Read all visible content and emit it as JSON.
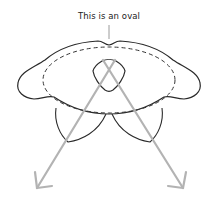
{
  "diagram": {
    "label": "This is an oval",
    "colors": {
      "outline": "#2a2a2a",
      "dashed_oval": "#333333",
      "arrow": "#b3b3b3",
      "pointer": "#9a9a9a",
      "background": "#ffffff"
    },
    "elements": [
      {
        "id": "outer-shape",
        "type": "outline",
        "description": "bumpy rounded outline with left and right lobes"
      },
      {
        "id": "dashed-oval",
        "type": "ellipse",
        "style": "dashed"
      },
      {
        "id": "rounded-triangle",
        "type": "shape",
        "description": "downward-pointing rounded triangle"
      },
      {
        "id": "left-petal",
        "type": "shape"
      },
      {
        "id": "right-petal",
        "type": "shape"
      },
      {
        "id": "left-arrow",
        "type": "arrow",
        "direction": "down-left"
      },
      {
        "id": "right-arrow",
        "type": "arrow",
        "direction": "down-right"
      }
    ]
  }
}
